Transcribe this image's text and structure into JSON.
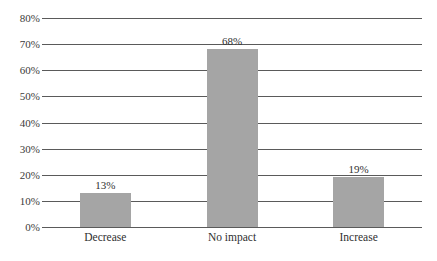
{
  "chart_data": {
    "type": "bar",
    "title": "",
    "subtitle": "",
    "xlabel": "",
    "ylabel": "",
    "categories": [
      "Decrease",
      "No impact",
      "Increase"
    ],
    "values": [
      13,
      68,
      19
    ],
    "data_labels": [
      "13%",
      "68%",
      "19%"
    ],
    "ylim": [
      0,
      80
    ],
    "ytick_values": [
      0,
      10,
      20,
      30,
      40,
      50,
      60,
      70,
      80
    ],
    "ytick_labels": [
      "0%",
      "10%",
      "20%",
      "30%",
      "40%",
      "50%",
      "60%",
      "70%",
      "80%"
    ],
    "grid": true,
    "grid_axis": "y",
    "legend": false,
    "legend_position": "none",
    "series": [
      {
        "name": "",
        "values": [
          13,
          68,
          19
        ],
        "color": "#a5a5a5"
      }
    ],
    "colors": {
      "bar_fill": "#a5a5a5",
      "gridline": "#5a5a5a",
      "axis_text": "#3b3b3b",
      "label_text": "#2f2f2f",
      "background": "#ffffff"
    }
  }
}
